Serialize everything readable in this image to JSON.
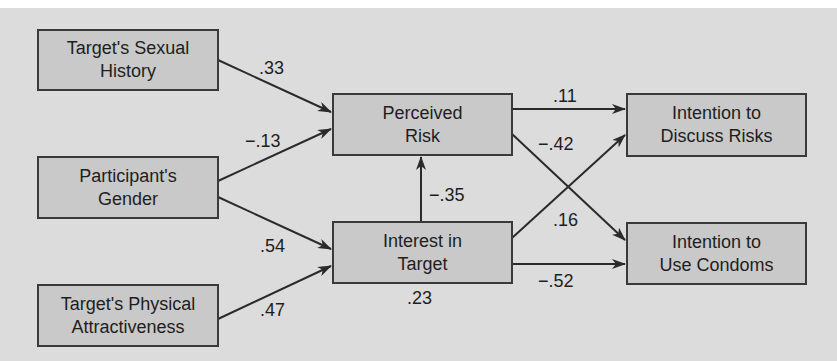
{
  "diagram": {
    "type": "path-model",
    "nodes": [
      {
        "id": "sexual_history",
        "line1": "Target's Sexual",
        "line2": "History"
      },
      {
        "id": "gender",
        "line1": "Participant's",
        "line2": "Gender"
      },
      {
        "id": "attractiveness",
        "line1": "Target's Physical",
        "line2": "Attractiveness"
      },
      {
        "id": "perceived_risk",
        "line1": "Perceived",
        "line2": "Risk"
      },
      {
        "id": "interest",
        "line1": "Interest in",
        "line2": "Target"
      },
      {
        "id": "discuss_risks",
        "line1": "Intention to",
        "line2": "Discuss Risks"
      },
      {
        "id": "use_condoms",
        "line1": "Intention to",
        "line2": "Use Condoms"
      }
    ],
    "edges": [
      {
        "from": "sexual_history",
        "to": "perceived_risk",
        "coef": ".33"
      },
      {
        "from": "gender",
        "to": "perceived_risk",
        "coef": "−.13"
      },
      {
        "from": "gender",
        "to": "interest",
        "coef": ".54"
      },
      {
        "from": "attractiveness",
        "to": "interest",
        "coef": ".47"
      },
      {
        "from": "interest",
        "to": "perceived_risk",
        "coef": "−.35"
      },
      {
        "from": "perceived_risk",
        "to": "discuss_risks",
        "coef": ".11"
      },
      {
        "from": "perceived_risk",
        "to": "use_condoms",
        "coef": "−.42"
      },
      {
        "from": "interest",
        "to": "discuss_risks",
        "coef": ".16"
      },
      {
        "from": "interest",
        "to": "use_condoms",
        "coef": "−.52"
      }
    ],
    "annotations": [
      {
        "target": "interest",
        "text": ".23"
      }
    ],
    "colors": {
      "background": "#dcdcdc",
      "box_fill": "#c9c9c9",
      "stroke": "#3a3a3a",
      "text": "#1e1e1e"
    }
  }
}
